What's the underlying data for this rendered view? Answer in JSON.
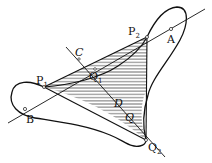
{
  "diagram": {
    "type": "geometric-figure",
    "labels": {
      "P2": {
        "text": "P",
        "sub": "2"
      },
      "A": {
        "text": "A"
      },
      "P1": {
        "text": "P",
        "sub": "1"
      },
      "B": {
        "text": "B"
      },
      "C": {
        "text": "C"
      },
      "Q1": {
        "text": "Q",
        "sub": "1"
      },
      "D": {
        "text": "D"
      },
      "Q": {
        "text": "Q"
      },
      "Q2": {
        "text": "Q",
        "sub": "2"
      }
    },
    "points": {
      "P1": [
        44,
        87
      ],
      "P2": [
        147,
        37
      ],
      "Q2": [
        146,
        140
      ],
      "A": [
        171,
        29
      ],
      "B": [
        25,
        109
      ],
      "C": [
        79,
        59
      ],
      "Q1": [
        95,
        69
      ],
      "D": [
        113,
        98
      ],
      "Q": [
        126,
        114
      ]
    },
    "colors": {
      "stroke": "#111111",
      "hatch": "#222222",
      "background": "#ffffff"
    }
  }
}
